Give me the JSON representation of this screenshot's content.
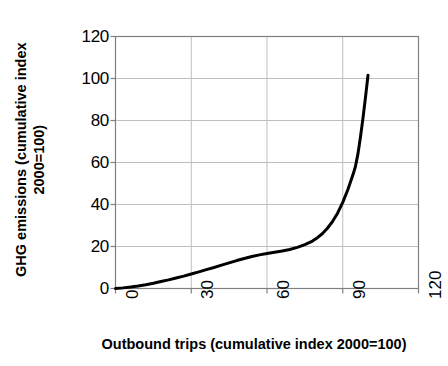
{
  "chart_data": {
    "type": "line",
    "title": "",
    "xlabel": "Outbound trips (cumulative index 2000=100)",
    "ylabel_line1": "GHG emissions (cumulative index",
    "ylabel_line2": "2000=100)",
    "ylabel": "GHG emissions (cumulative index 2000=100)",
    "xlim": [
      0,
      120
    ],
    "ylim": [
      0,
      120
    ],
    "xticks": [
      0,
      30,
      60,
      90,
      120
    ],
    "yticks": [
      0,
      20,
      40,
      60,
      80,
      100,
      120
    ],
    "grid": true,
    "legend": "none",
    "series": [
      {
        "name": "GHG emissions vs outbound trips",
        "color": "#000000",
        "line_width": 3,
        "x": [
          0,
          3,
          6,
          9,
          12,
          15,
          18,
          21,
          24,
          27,
          30,
          33,
          36,
          39,
          42,
          45,
          48,
          51,
          54,
          57,
          60,
          63,
          66,
          69,
          72,
          75,
          78,
          80,
          82,
          84,
          86,
          88,
          90,
          92,
          94,
          95,
          96,
          97,
          98,
          99,
          100
        ],
        "y": [
          0,
          0.3,
          0.7,
          1.2,
          1.8,
          2.5,
          3.3,
          4.1,
          5.0,
          5.9,
          6.9,
          7.9,
          9.0,
          10.0,
          11.1,
          12.2,
          13.3,
          14.3,
          15.2,
          16.0,
          16.7,
          17.3,
          17.9,
          18.6,
          19.6,
          20.9,
          22.6,
          24.2,
          26.2,
          28.8,
          32.0,
          36.0,
          41.0,
          47.0,
          54.0,
          58.0,
          64.0,
          72.0,
          81.0,
          91.0,
          101.5
        ]
      }
    ]
  },
  "axis_style": {
    "grid_color": "#bfbfbf",
    "frame_color": "#808080",
    "line_color": "#000000",
    "background": "#ffffff"
  }
}
